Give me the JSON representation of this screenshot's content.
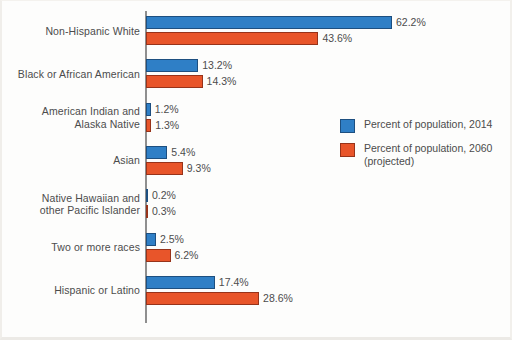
{
  "chart_data": {
    "type": "bar",
    "orientation": "horizontal",
    "title": "",
    "subtitle": "",
    "xlabel": "",
    "ylabel": "",
    "grid": false,
    "legend_position": "center-right",
    "xlim": [
      0,
      62.2
    ],
    "value_suffix": "%",
    "categories": [
      "Non-Hispanic White",
      "Black or African American",
      "American Indian and\nAlaska Native",
      "Asian",
      "Native Hawaiian and\nother Pacific Islander",
      "Two or more races",
      "Hispanic or Latino"
    ],
    "series": [
      {
        "name": "Percent of population, 2014",
        "color": "#2f7fc6",
        "values": [
          62.2,
          13.2,
          1.2,
          5.4,
          0.2,
          2.5,
          17.4
        ],
        "labels": [
          "62.2%",
          "13.2%",
          "1.2%",
          "5.4%",
          "0.2%",
          "2.5%",
          "17.4%"
        ]
      },
      {
        "name": "Percent of population, 2060\n(projected)",
        "color": "#e8552a",
        "values": [
          43.6,
          14.3,
          1.3,
          9.3,
          0.3,
          6.2,
          28.6
        ],
        "labels": [
          "43.6%",
          "14.3%",
          "1.3%",
          "9.3%",
          "0.3%",
          "6.2%",
          "28.6%"
        ]
      }
    ]
  },
  "legend": {
    "items": [
      {
        "label": "Percent of population, 2014"
      },
      {
        "label": "Percent of population, 2060\n(projected)"
      }
    ]
  }
}
